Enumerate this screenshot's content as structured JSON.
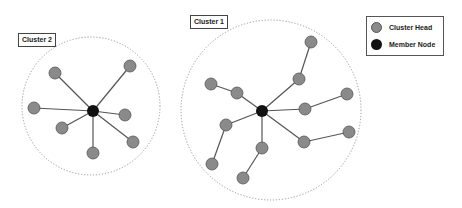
{
  "colors": {
    "cluster_head": "#8a8a8a",
    "cluster_head_stroke": "#555555",
    "member_node": "#111111",
    "edge": "#555555",
    "boundary": "#999999"
  },
  "clusters": [
    {
      "label": "Cluster 2",
      "boundary": {
        "cx": 91,
        "cy": 106,
        "r": 69
      },
      "center": {
        "x": 93,
        "y": 111
      },
      "nodes": [
        {
          "x": 55,
          "y": 73
        },
        {
          "x": 130,
          "y": 66
        },
        {
          "x": 34,
          "y": 108
        },
        {
          "x": 125,
          "y": 115
        },
        {
          "x": 62,
          "y": 128
        },
        {
          "x": 133,
          "y": 142
        },
        {
          "x": 93,
          "y": 153
        }
      ],
      "edges": [
        [
          93,
          111,
          55,
          73
        ],
        [
          93,
          111,
          130,
          66
        ],
        [
          93,
          111,
          34,
          108
        ],
        [
          93,
          111,
          125,
          115
        ],
        [
          93,
          111,
          62,
          128
        ],
        [
          93,
          111,
          133,
          142
        ],
        [
          93,
          111,
          93,
          153
        ]
      ]
    },
    {
      "label": "Cluster 1",
      "boundary": {
        "cx": 271,
        "cy": 110,
        "r": 90
      },
      "center": {
        "x": 262,
        "y": 111
      },
      "nodes": [
        {
          "x": 311,
          "y": 42
        },
        {
          "x": 299,
          "y": 79
        },
        {
          "x": 211,
          "y": 84
        },
        {
          "x": 237,
          "y": 93
        },
        {
          "x": 305,
          "y": 109
        },
        {
          "x": 347,
          "y": 94
        },
        {
          "x": 226,
          "y": 125
        },
        {
          "x": 262,
          "y": 148
        },
        {
          "x": 304,
          "y": 142
        },
        {
          "x": 349,
          "y": 132
        },
        {
          "x": 212,
          "y": 164
        },
        {
          "x": 243,
          "y": 178
        }
      ],
      "edges": [
        [
          262,
          111,
          299,
          79
        ],
        [
          299,
          79,
          311,
          42
        ],
        [
          262,
          111,
          237,
          93
        ],
        [
          237,
          93,
          211,
          84
        ],
        [
          262,
          111,
          305,
          109
        ],
        [
          305,
          109,
          347,
          94
        ],
        [
          262,
          111,
          226,
          125
        ],
        [
          226,
          125,
          212,
          164
        ],
        [
          262,
          111,
          262,
          148
        ],
        [
          262,
          148,
          243,
          178
        ],
        [
          262,
          111,
          304,
          142
        ],
        [
          304,
          142,
          349,
          132
        ]
      ]
    }
  ],
  "labels": {
    "cluster2": "Cluster 2",
    "cluster1": "Cluster 1"
  },
  "legend": {
    "items": [
      {
        "label": "Cluster Head",
        "icon": "gray-circle-icon"
      },
      {
        "label": "Member Node",
        "icon": "black-circle-icon"
      }
    ]
  }
}
